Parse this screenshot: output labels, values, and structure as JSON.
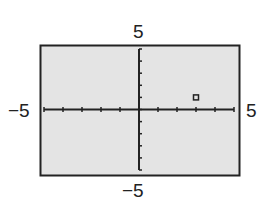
{
  "chart_data": {
    "type": "scatter",
    "title": "",
    "xlabel": "",
    "ylabel": "",
    "xlim": [
      -5,
      5
    ],
    "ylim": [
      -5,
      5
    ],
    "x_tick_step": 1,
    "y_tick_step": 1,
    "grid": false,
    "legend": null,
    "window_labels": {
      "xmin": "−5",
      "xmax": "5",
      "ymin": "−5",
      "ymax": "5"
    },
    "series": [
      {
        "name": "point",
        "marker": "square",
        "points": [
          {
            "x": 3,
            "y": 1
          }
        ]
      }
    ]
  },
  "colors": {
    "screen_background": "#e4e4e4",
    "frame": "#222222",
    "axes": "#222222",
    "marker": "#222222"
  }
}
